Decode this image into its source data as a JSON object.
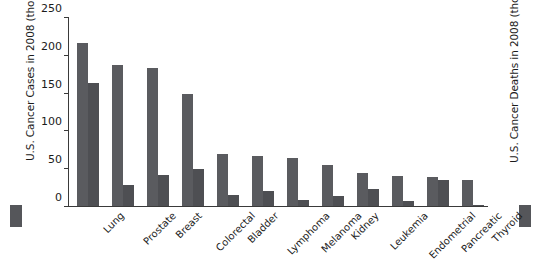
{
  "chart_data": {
    "type": "bar",
    "title": "",
    "xlabel": "",
    "ylabel": "U.S. Cancer Cases in 2008 (thousands)",
    "ylabel_right": "U.S. Cancer Deaths in 2008 (thousands)",
    "ylim": [
      0,
      250
    ],
    "yticks": [
      0,
      50,
      100,
      150,
      200,
      250
    ],
    "ytick_labels": [
      "0",
      "50",
      "100",
      "150",
      "200",
      "250"
    ],
    "grid": false,
    "legend_position": "outside-left-and-right",
    "categories": [
      "Lung",
      "Prostate",
      "Breast",
      "Colorectal",
      "Bladder",
      "Lymphoma",
      "Melanoma",
      "Kidney",
      "Leukemia",
      "Endometrial",
      "Pancreatic",
      "Thyroid"
    ],
    "series": [
      {
        "name": "U.S. Cancer Cases in 2008 (thousands)",
        "color": "#5a5b5f",
        "values": [
          215,
          186,
          182,
          148,
          69,
          66,
          63,
          54,
          44,
          40,
          38,
          34
        ]
      },
      {
        "name": "U.S. Cancer Deaths in 2008 (thousands)",
        "color": "#4e4f53",
        "values": [
          163,
          28,
          41,
          49,
          14,
          20,
          8,
          13,
          22,
          7,
          34,
          2
        ]
      }
    ]
  },
  "legend": {
    "cases_swatch": "cases-color-swatch",
    "deaths_swatch": "deaths-color-swatch"
  }
}
